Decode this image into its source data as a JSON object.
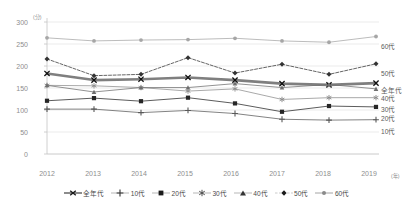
{
  "chart_data": {
    "type": "line",
    "title": "",
    "xlabel": "(年)",
    "ylabel": "(分)",
    "x": [
      "2012",
      "2013",
      "2014",
      "2015",
      "2016",
      "2017",
      "2018",
      "2019"
    ],
    "categories": [
      "2012",
      "2013",
      "2014",
      "2015",
      "2016",
      "2017",
      "2018",
      "2019"
    ],
    "ylim": [
      0,
      300
    ],
    "yticks": [
      "0",
      "50",
      "100",
      "150",
      "200",
      "250",
      "300"
    ],
    "grid": true,
    "legend_position": "bottom",
    "series": [
      {
        "name": "全年代",
        "marker": "x",
        "color": "#7f7f7f",
        "values": [
          183,
          168,
          170,
          174,
          168,
          160,
          157,
          161
        ]
      },
      {
        "name": "10代",
        "marker": "plus",
        "color": "#595959",
        "values": [
          102,
          102,
          94,
          99,
          92,
          79,
          77,
          78
        ]
      },
      {
        "name": "20代",
        "marker": "square",
        "color": "#262626",
        "values": [
          121,
          127,
          120,
          128,
          115,
          96,
          109,
          107
        ]
      },
      {
        "name": "30代",
        "marker": "asterisk",
        "color": "#8c8c8c",
        "values": [
          156,
          155,
          151,
          143,
          148,
          124,
          128,
          128
        ]
      },
      {
        "name": "40代",
        "marker": "triangle",
        "color": "#6e6e6e",
        "values": [
          156,
          141,
          151,
          151,
          160,
          151,
          158,
          148
        ]
      },
      {
        "name": "50代",
        "marker": "diamond",
        "color": "#333333",
        "values": [
          216,
          178,
          181,
          219,
          184,
          204,
          181,
          205
        ]
      },
      {
        "name": "60代",
        "marker": "circle",
        "color": "#a6a6a6",
        "values": [
          264,
          257,
          259,
          260,
          263,
          257,
          254,
          267
        ]
      }
    ],
    "right_labels": [
      {
        "name": "60代",
        "value": 267
      },
      {
        "name": "50代",
        "value": 205
      },
      {
        "name": "全年代",
        "value": 161
      },
      {
        "name": "40代",
        "value": 148
      },
      {
        "name": "30代",
        "value": 128
      },
      {
        "name": "20代",
        "value": 107
      },
      {
        "name": "10代",
        "value": 78
      }
    ],
    "legend": [
      "全年代",
      "10代",
      "20代",
      "30代",
      "40代",
      "50代",
      "60代"
    ]
  }
}
